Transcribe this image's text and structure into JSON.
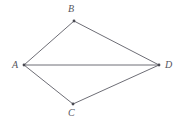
{
  "figure": {
    "shape_type": "kite",
    "background_color": "#ffffff",
    "stroke_color": "#6e6e76",
    "label_color": "#55555d",
    "canvas": {
      "width": 183,
      "height": 122
    },
    "vertices": [
      {
        "id": "A",
        "label": "A",
        "x": 24,
        "y": 65,
        "label_x": 12,
        "label_y": 60
      },
      {
        "id": "B",
        "label": "B",
        "x": 74,
        "y": 21,
        "label_x": 68,
        "label_y": 4
      },
      {
        "id": "C",
        "label": "C",
        "x": 73,
        "y": 104,
        "label_x": 68,
        "label_y": 108
      },
      {
        "id": "D",
        "label": "D",
        "x": 159,
        "y": 65,
        "label_x": 165,
        "label_y": 60
      }
    ],
    "edges": [
      {
        "id": "AB",
        "from": "A",
        "to": "B",
        "path": "M 24 65 L 74 21"
      },
      {
        "id": "BD",
        "from": "B",
        "to": "D",
        "path": "M 74 21 L 159 65"
      },
      {
        "id": "DC",
        "from": "D",
        "to": "C",
        "path": "M 159 65 L 73 104"
      },
      {
        "id": "CA",
        "from": "C",
        "to": "A",
        "path": "M 73 104 L 24 65"
      }
    ],
    "diagonal": {
      "id": "AD",
      "from": "A",
      "to": "D",
      "path": "M 24 65 L 159 65"
    }
  }
}
